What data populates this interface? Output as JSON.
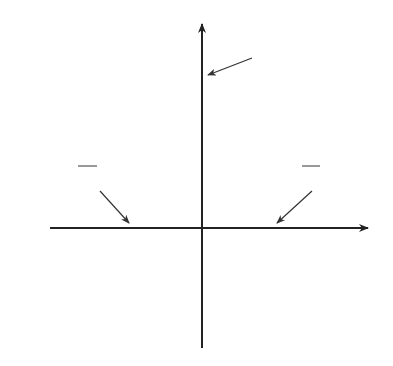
{
  "chart_data": {
    "type": "line",
    "title": "",
    "function": "y = 5 - x^2",
    "xlabel": "x",
    "ylabel": "y",
    "grid": true,
    "xlim": [
      -6,
      6
    ],
    "ylim": [
      -4,
      7
    ],
    "series": [
      {
        "name": "parabola",
        "x": [
          -3.06,
          -2.5,
          -2.236,
          -2,
          -1.5,
          -1,
          -0.5,
          0,
          0.5,
          1,
          1.5,
          2,
          2.236,
          2.5,
          3.06
        ],
        "y": [
          -4.36,
          -1.25,
          0,
          1,
          2.75,
          4,
          4.75,
          5,
          4.75,
          4,
          2.75,
          1,
          0,
          -1.25,
          -4.36
        ]
      }
    ],
    "annotations": [
      {
        "text": "(0, 5)",
        "point": [
          0,
          5
        ]
      },
      {
        "text": "(−√5, 0)",
        "point": [
          -2.236,
          0
        ]
      },
      {
        "text": "(√5, 0)",
        "point": [
          2.236,
          0
        ]
      }
    ]
  },
  "labels": {
    "x_axis": "x",
    "y_axis": "y",
    "vertex": "(0, 5)",
    "left_root_open": "(",
    "left_root_body": "−√5, 0",
    "left_root_close": ")",
    "right_root_open": "(",
    "right_root_body": "√5, 0",
    "right_root_close": ")"
  },
  "colors": {
    "grid": "#c8c8c8",
    "axis": "#222222",
    "curve": "#4a4a4a",
    "text": "#333333"
  }
}
